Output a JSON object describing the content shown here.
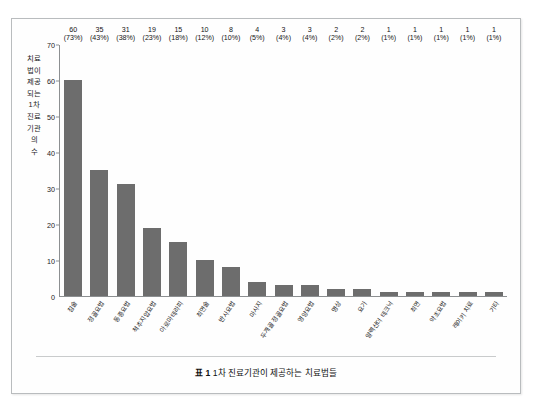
{
  "figure": {
    "caption_prefix": "표 1",
    "caption_text": "1차 진료기관이 제공하는 치료법들"
  },
  "chart_data": {
    "type": "bar",
    "title": "",
    "xlabel": "",
    "ylabel": "치료법이 제공되는 1차 진료기관의 수",
    "ylim": [
      0,
      70
    ],
    "yticks": [
      0,
      10,
      20,
      30,
      40,
      50,
      60,
      70
    ],
    "grid": false,
    "legend": "none",
    "bar_color": "#6d6d6d",
    "axis_color": "#8c8f91",
    "categories": [
      "침술",
      "정골요법",
      "동종요법",
      "척추지압요법",
      "아로마테라피",
      "최면술",
      "반사요법",
      "마사지",
      "두개골 정골요법",
      "영양요법",
      "명상",
      "요가",
      "알렉산더 테크닉",
      "최면",
      "약초요법",
      "레이키 치료",
      "기타"
    ],
    "values": [
      60,
      35,
      31,
      19,
      15,
      10,
      8,
      4,
      3,
      3,
      2,
      2,
      1,
      1,
      1,
      1,
      1
    ],
    "percents": [
      "73%",
      "43%",
      "38%",
      "23%",
      "18%",
      "12%",
      "10%",
      "5%",
      "4%",
      "4%",
      "2%",
      "2%",
      "1%",
      "1%",
      "1%",
      "1%",
      "1%"
    ],
    "data_labels": [
      {
        "value": "60",
        "percent": "(73%)"
      },
      {
        "value": "35",
        "percent": "(43%)"
      },
      {
        "value": "31",
        "percent": "(38%)"
      },
      {
        "value": "19",
        "percent": "(23%)"
      },
      {
        "value": "15",
        "percent": "(18%)"
      },
      {
        "value": "10",
        "percent": "(12%)"
      },
      {
        "value": "8",
        "percent": "(10%)"
      },
      {
        "value": "4",
        "percent": "(5%)"
      },
      {
        "value": "3",
        "percent": "(4%)"
      },
      {
        "value": "3",
        "percent": "(4%)"
      },
      {
        "value": "2",
        "percent": "(2%)"
      },
      {
        "value": "2",
        "percent": "(2%)"
      },
      {
        "value": "1",
        "percent": "(1%)"
      },
      {
        "value": "1",
        "percent": "(1%)"
      },
      {
        "value": "1",
        "percent": "(1%)"
      },
      {
        "value": "1",
        "percent": "(1%)"
      },
      {
        "value": "1",
        "percent": "(1%)"
      }
    ]
  }
}
